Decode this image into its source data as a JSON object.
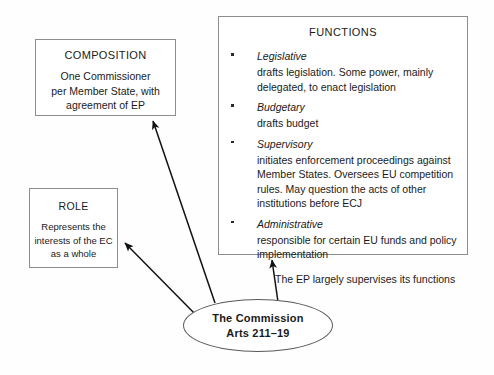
{
  "diagram": {
    "title_hidden": "",
    "composition": {
      "title": "COMPOSITION",
      "lines": [
        "One Commissioner",
        "per Member State, with",
        "agreement of EP"
      ]
    },
    "role": {
      "title": "ROLE",
      "lines": [
        "Represents the",
        "interests of the EC",
        "as a whole"
      ]
    },
    "functions": {
      "title": "FUNCTIONS",
      "items": [
        {
          "heading": "Legislative",
          "body": "drafts legislation. Some power, mainly delegated, to enact legislation"
        },
        {
          "heading": "Budgetary",
          "body": "drafts budget"
        },
        {
          "heading": "Supervisory",
          "body": "initiates enforcement proceedings against Member States. Oversees EU competition rules. May question the acts of other institutions before ECJ"
        },
        {
          "heading": "Administrative",
          "body": "responsible for certain EU funds and policy implementation"
        }
      ],
      "footer": "The EP largely supervises its functions"
    },
    "central_node": {
      "line1": "The Commission",
      "line2": "Arts 211–19"
    },
    "connectors": [
      {
        "name": "arrow-to-composition",
        "from": "central-node",
        "to": "composition-box"
      },
      {
        "name": "arrow-to-role",
        "from": "central-node",
        "to": "role-box"
      },
      {
        "name": "arrow-to-functions",
        "from": "central-node",
        "to": "functions-box"
      }
    ],
    "colors": {
      "background": "#fefefe",
      "box_border": "#8d8d8d",
      "ellipse_border": "#5a5a5a",
      "text": "#1a1a1a",
      "connector": "#111111"
    }
  }
}
